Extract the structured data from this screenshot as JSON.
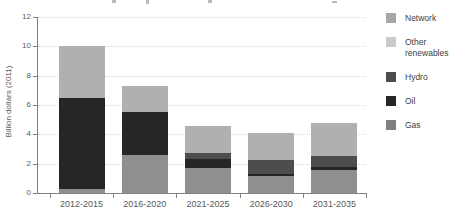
{
  "chart_data": {
    "type": "bar",
    "stacked": true,
    "title": "",
    "xlabel": "",
    "ylabel": "Billion dollars (2011)",
    "ylim": [
      0,
      12
    ],
    "ytick_step": 2,
    "grid": true,
    "legend_position": "right",
    "categories": [
      "2012-2015",
      "2016-2020",
      "2021-2025",
      "2026-2030",
      "2031-2035"
    ],
    "series": [
      {
        "name": "Gas",
        "color": "#8f8f8f",
        "values": [
          0.3,
          2.6,
          1.7,
          1.15,
          1.55
        ]
      },
      {
        "name": "Oil",
        "color": "#262626",
        "values": [
          6.2,
          2.9,
          0.6,
          0.15,
          0.2
        ]
      },
      {
        "name": "Hydro",
        "color": "#4d4d4d",
        "values": [
          0,
          0,
          0.4,
          0.95,
          0.75
        ]
      },
      {
        "name": "Other renewables",
        "color": "#c9c9c9",
        "values": [
          0,
          0,
          0,
          0,
          0
        ]
      },
      {
        "name": "Network",
        "color": "#b0b0b0",
        "values": [
          3.5,
          1.8,
          1.9,
          1.85,
          2.25
        ]
      }
    ],
    "bar_totals": [
      10.0,
      7.3,
      4.6,
      4.1,
      4.75
    ],
    "legend_order": [
      "Network",
      "Other renewables",
      "Hydro",
      "Oil",
      "Gas"
    ],
    "legend_swatch_colors": {
      "Network": "#a6a6a6",
      "Other renewables": "#c9c9c9",
      "Hydro": "#4d4d4d",
      "Oil": "#262626",
      "Gas": "#7f7f7f"
    },
    "axis_text_color": "#595959",
    "legend_text_color": "#404040"
  }
}
